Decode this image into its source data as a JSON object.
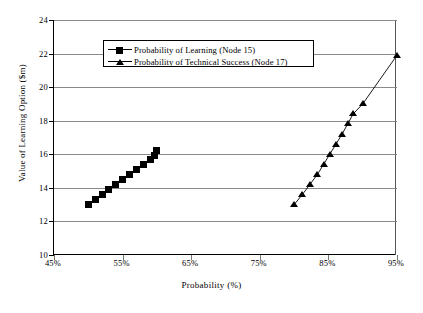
{
  "chart_data": {
    "type": "scatter",
    "title": "",
    "xlabel": "Probability  (%)",
    "ylabel": "Value of Learning Option ($m)",
    "xlim": [
      45,
      95
    ],
    "ylim": [
      10,
      24
    ],
    "xticks": [
      "45%",
      "55%",
      "65%",
      "75%",
      "85%",
      "95%"
    ],
    "xtick_values": [
      45,
      55,
      65,
      75,
      85,
      95
    ],
    "yticks": [
      "24",
      "22",
      "20",
      "18",
      "16",
      "14",
      "12",
      "10"
    ],
    "ytick_values": [
      24,
      22,
      20,
      18,
      16,
      14,
      12,
      10
    ],
    "grid": "horizontal",
    "legend_position": "upper-left-inside",
    "series": [
      {
        "name": "Probability of Learning (Node 15)",
        "marker": "filled-square",
        "color": "#000000",
        "points": [
          {
            "x": 50.0,
            "y": 13.0
          },
          {
            "x": 51.0,
            "y": 13.3
          },
          {
            "x": 52.0,
            "y": 13.6
          },
          {
            "x": 53.0,
            "y": 13.9
          },
          {
            "x": 54.0,
            "y": 14.2
          },
          {
            "x": 55.0,
            "y": 14.5
          },
          {
            "x": 56.0,
            "y": 14.8
          },
          {
            "x": 57.0,
            "y": 15.1
          },
          {
            "x": 58.0,
            "y": 15.4
          },
          {
            "x": 59.0,
            "y": 15.7
          },
          {
            "x": 59.6,
            "y": 15.9
          },
          {
            "x": 60.0,
            "y": 16.2
          }
        ]
      },
      {
        "name": "Probability of Technical Success (Node 17)",
        "marker": "filled-triangle",
        "color": "#000000",
        "points": [
          {
            "x": 80.0,
            "y": 13.0
          },
          {
            "x": 81.2,
            "y": 13.6
          },
          {
            "x": 82.3,
            "y": 14.2
          },
          {
            "x": 83.4,
            "y": 14.8
          },
          {
            "x": 84.3,
            "y": 15.4
          },
          {
            "x": 85.2,
            "y": 16.0
          },
          {
            "x": 86.1,
            "y": 16.6
          },
          {
            "x": 87.0,
            "y": 17.2
          },
          {
            "x": 87.8,
            "y": 17.8
          },
          {
            "x": 88.6,
            "y": 18.4
          },
          {
            "x": 90.0,
            "y": 19.0
          },
          {
            "x": 95.0,
            "y": 21.9
          }
        ]
      }
    ]
  }
}
